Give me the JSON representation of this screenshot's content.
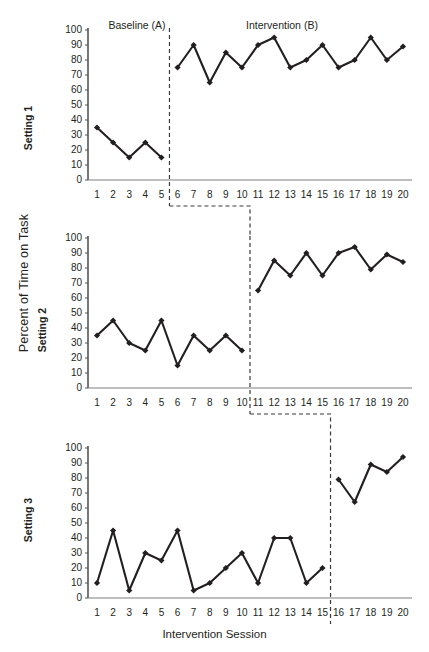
{
  "axes": {
    "ylabel": "Percent of Time on Task",
    "xlabel": "Intervention Session",
    "yticks": [
      "100",
      "90",
      "80",
      "70",
      "60",
      "50",
      "40",
      "30",
      "20",
      "10",
      "0"
    ],
    "xticks": [
      "1",
      "2",
      "3",
      "4",
      "5",
      "6",
      "7",
      "8",
      "9",
      "10",
      "11",
      "12",
      "13",
      "14",
      "15",
      "16",
      "17",
      "18",
      "19",
      "20"
    ]
  },
  "phase_captions": {
    "baseline": "Baseline (A)",
    "intervention": "Intervention (B)"
  },
  "panel_labels": {
    "setting1": "Setting 1",
    "setting2": "Setting 2",
    "setting3": "Setting 3"
  },
  "colors": {
    "series": "#231f20",
    "axis": "#7f7f7f",
    "phase_line": "#3b3b3b",
    "text": "#231f20",
    "background": "#ffffff"
  },
  "chart_data": {
    "type": "line",
    "title": "",
    "xlabel": "Intervention Session",
    "ylabel": "Percent of Time on Task",
    "xlim": [
      1,
      20
    ],
    "ylim": [
      0,
      100
    ],
    "ytick_step": 10,
    "grid": false,
    "legend": false,
    "design": "multiple-baseline across settings",
    "marker": "diamond",
    "x": [
      1,
      2,
      3,
      4,
      5,
      6,
      7,
      8,
      9,
      10,
      11,
      12,
      13,
      14,
      15,
      16,
      17,
      18,
      19,
      20
    ],
    "panels": [
      {
        "name": "Setting 1",
        "phase_change_after_session": 5,
        "phases": [
          {
            "label": "Baseline (A)",
            "sessions": [
              1,
              2,
              3,
              4,
              5
            ],
            "values": [
              35,
              25,
              15,
              25,
              15
            ]
          },
          {
            "label": "Intervention (B)",
            "sessions": [
              6,
              7,
              8,
              9,
              10,
              11,
              12,
              13,
              14,
              15,
              16,
              17,
              18,
              19,
              20
            ],
            "values": [
              75,
              90,
              65,
              85,
              75,
              90,
              95,
              75,
              80,
              90,
              75,
              80,
              95,
              80,
              89
            ]
          }
        ]
      },
      {
        "name": "Setting 2",
        "phase_change_after_session": 10,
        "phases": [
          {
            "label": "Baseline (A)",
            "sessions": [
              1,
              2,
              3,
              4,
              5,
              6,
              7,
              8,
              9,
              10
            ],
            "values": [
              35,
              45,
              30,
              25,
              45,
              15,
              35,
              25,
              35,
              25
            ]
          },
          {
            "label": "Intervention (B)",
            "sessions": [
              11,
              12,
              13,
              14,
              15,
              16,
              17,
              18,
              19,
              20
            ],
            "values": [
              65,
              85,
              75,
              90,
              75,
              90,
              94,
              79,
              89,
              84
            ]
          }
        ]
      },
      {
        "name": "Setting 3",
        "phase_change_after_session": 15,
        "phases": [
          {
            "label": "Baseline (A)",
            "sessions": [
              1,
              2,
              3,
              4,
              5,
              6,
              7,
              8,
              9,
              10,
              11,
              12,
              13,
              14,
              15
            ],
            "values": [
              10,
              45,
              5,
              30,
              25,
              45,
              5,
              10,
              20,
              30,
              10,
              40,
              40,
              10,
              20
            ]
          },
          {
            "label": "Intervention (B)",
            "sessions": [
              16,
              17,
              18,
              19,
              20
            ],
            "values": [
              79,
              64,
              89,
              84,
              94
            ]
          }
        ]
      }
    ]
  }
}
